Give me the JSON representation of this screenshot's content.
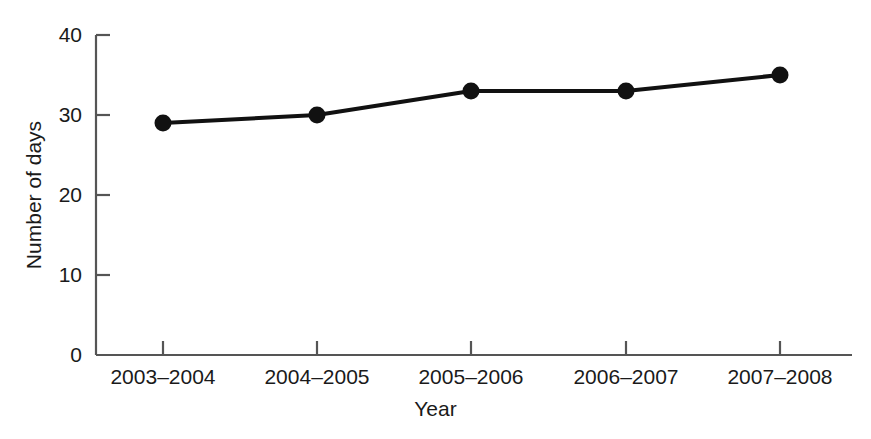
{
  "chart_data": {
    "type": "line",
    "title": "",
    "xlabel": "Year",
    "ylabel": "Number of days",
    "categories": [
      "2003–2004",
      "2004–2005",
      "2005–2006",
      "2006–2007",
      "2007–2008"
    ],
    "values": [
      29,
      30,
      33,
      33,
      35
    ],
    "series": [
      {
        "name": "Number of days",
        "values": [
          29,
          30,
          33,
          33,
          35
        ]
      }
    ],
    "ylim": [
      0,
      40
    ],
    "yticks": [
      0,
      10,
      20,
      30,
      40
    ],
    "ytick_labels": [
      "0",
      "10",
      "20",
      "30",
      "40"
    ],
    "xtick_labels": [
      "2003–2004",
      "2004–2005",
      "2005–2006",
      "2006–2007",
      "2007–2008"
    ],
    "grid": false,
    "legend": false,
    "legend_position": "none",
    "marker": "filled-circle",
    "line_color": "#111111",
    "marker_color": "#111111",
    "background_color": "#ffffff",
    "axis_color": "#555555"
  },
  "axes": {
    "y_title": "Number of days",
    "x_title": "Year",
    "y_ticks": [
      {
        "label": "40",
        "value": 40
      },
      {
        "label": "30",
        "value": 30
      },
      {
        "label": "20",
        "value": 20
      },
      {
        "label": "10",
        "value": 10
      },
      {
        "label": "0",
        "value": 0
      }
    ],
    "x_ticks": [
      {
        "label": "2003–2004"
      },
      {
        "label": "2004–2005"
      },
      {
        "label": "2005–2006"
      },
      {
        "label": "2006–2007"
      },
      {
        "label": "2007–2008"
      }
    ]
  }
}
